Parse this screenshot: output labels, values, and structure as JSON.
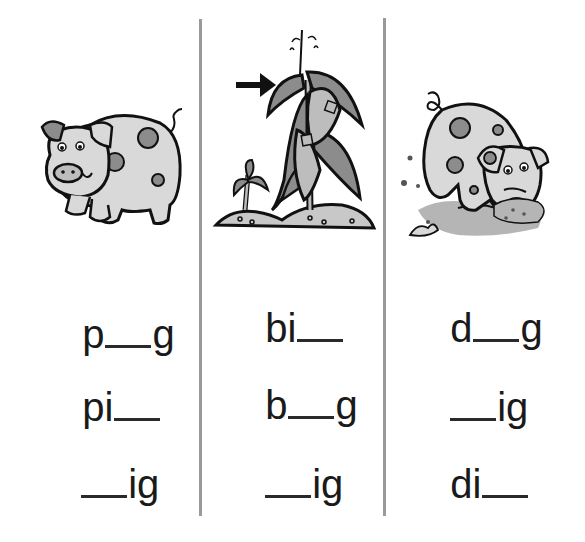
{
  "worksheet": {
    "columns": [
      {
        "picture": "pig-icon",
        "picture_description": "spotted pig standing",
        "words": [
          {
            "before": "p",
            "after": "g",
            "answer_pattern": "p__g"
          },
          {
            "before": "pi",
            "after": "",
            "answer_pattern": "pi__"
          },
          {
            "before": "",
            "after": "ig",
            "answer_pattern": "__ig"
          }
        ]
      },
      {
        "picture": "big-plant-icon",
        "picture_description": "big corn plant with arrow pointing at it next to small sprout",
        "arrow": "arrow-right-icon",
        "words": [
          {
            "before": "bi",
            "after": "",
            "answer_pattern": "bi__"
          },
          {
            "before": "b",
            "after": "g",
            "answer_pattern": "b__g"
          },
          {
            "before": "",
            "after": "ig",
            "answer_pattern": "__ig"
          }
        ]
      },
      {
        "picture": "digging-pig-icon",
        "picture_description": "spotted pig digging in dirt",
        "words": [
          {
            "before": "d",
            "after": "g",
            "answer_pattern": "d__g"
          },
          {
            "before": "",
            "after": "ig",
            "answer_pattern": "__ig"
          },
          {
            "before": "di",
            "after": "",
            "answer_pattern": "di__"
          }
        ]
      }
    ]
  },
  "colors": {
    "text": "#1a1a1a",
    "divider": "#9a9a9a",
    "illustration_fill": "#d9d9d9",
    "illustration_spot": "#8c8c8c",
    "illustration_outline": "#111111"
  }
}
